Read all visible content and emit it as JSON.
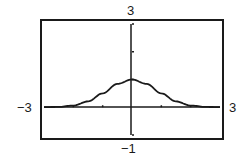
{
  "chart_data": {
    "type": "line",
    "title": "",
    "xlabel": "",
    "ylabel": "",
    "xlim": [
      -3,
      3
    ],
    "ylim": [
      -1,
      3
    ],
    "grid": false,
    "legend": null,
    "window_labels": {
      "xmin": "−3",
      "xmax": "3",
      "ymin": "−1",
      "ymax": "3"
    },
    "x_ticks": [
      -2,
      -1,
      0,
      1,
      2
    ],
    "y_ticks": [
      -1,
      0,
      1,
      2,
      3
    ],
    "series": [
      {
        "name": "bell curve",
        "x": [
          -3,
          -2.5,
          -2,
          -1.5,
          -1,
          -0.5,
          0,
          0.5,
          1,
          1.5,
          2,
          2.5,
          3
        ],
        "values": [
          0.002,
          0.013,
          0.06,
          0.21,
          0.5,
          0.84,
          1.0,
          0.84,
          0.5,
          0.21,
          0.06,
          0.013,
          0.002
        ]
      }
    ]
  },
  "colors": {
    "stroke": "#1a1a1a",
    "background": "#ffffff"
  }
}
